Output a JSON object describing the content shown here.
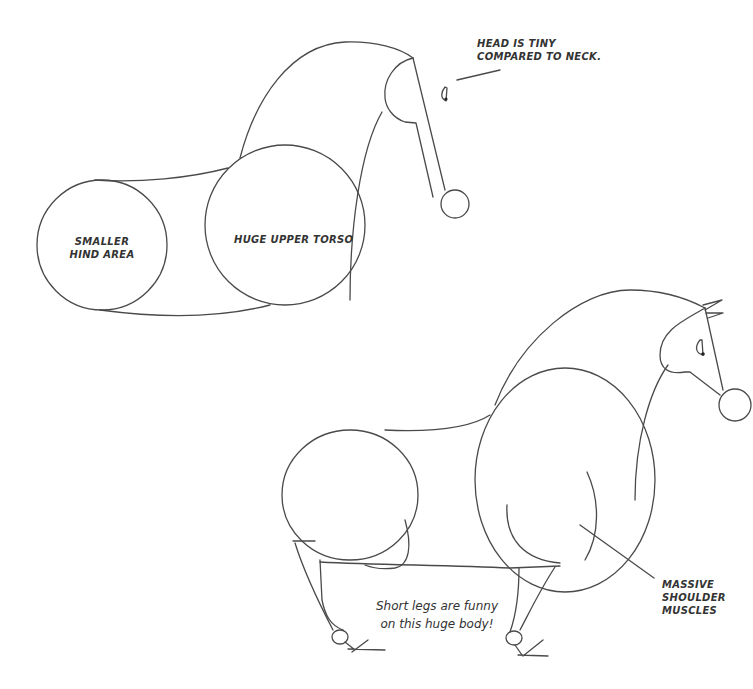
{
  "illustration": {
    "top_figure": {
      "labels": {
        "head_note": "HEAD IS TINY\nCOMPARED TO NECK.",
        "hind_note": "SMALLER\nHIND AREA",
        "torso_note": "HUGE UPPER TORSO"
      }
    },
    "bottom_figure": {
      "labels": {
        "shoulder_note": "MASSIVE\nSHOULDER\nMUSCLES",
        "legs_caption": "Short legs are funny\non this huge body!"
      }
    },
    "colors": {
      "line": "#4a4a4a",
      "text": "#333333",
      "background": "#ffffff"
    }
  }
}
